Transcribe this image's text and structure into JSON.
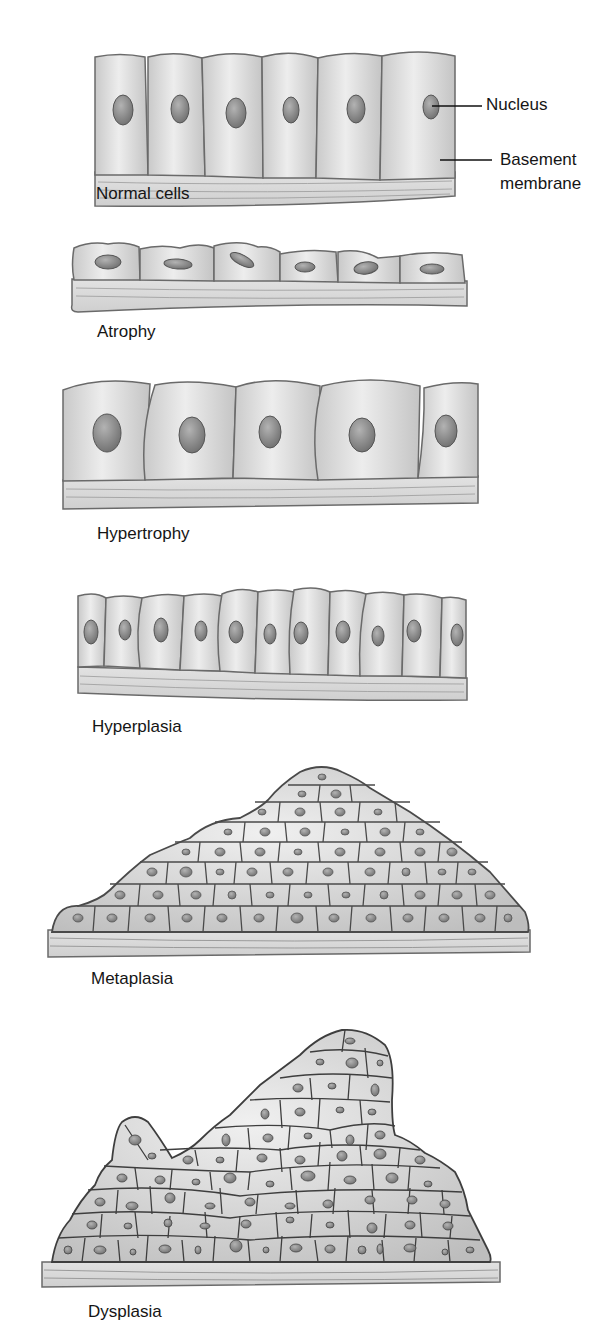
{
  "figure": {
    "panels": [
      {
        "id": "normal",
        "label": "Normal cells",
        "cell_count": 6,
        "nucleus_shape": "oval-vertical"
      },
      {
        "id": "atrophy",
        "label": "Atrophy",
        "cell_count": 6,
        "nucleus_shape": "flattened"
      },
      {
        "id": "hypertrophy",
        "label": "Hypertrophy",
        "cell_count": 5,
        "nucleus_shape": "oval-large"
      },
      {
        "id": "hyperplasia",
        "label": "Hyperplasia",
        "cell_count": 11,
        "nucleus_shape": "oval-small"
      },
      {
        "id": "metaplasia",
        "label": "Metaplasia",
        "cell_count": 60,
        "nucleus_shape": "round-small"
      },
      {
        "id": "dysplasia",
        "label": "Dysplasia",
        "cell_count": 80,
        "nucleus_shape": "irregular"
      }
    ],
    "callouts": {
      "nucleus": "Nucleus",
      "basement_line1": "Basement",
      "basement_line2": "membrane"
    },
    "colors": {
      "cell_fill": "#d9d9d9",
      "cell_stroke": "#6a6a6a",
      "nucleus_fill": "#8f8f8f",
      "membrane_fill": "#dcdcdc",
      "label_text": "#151515"
    }
  }
}
